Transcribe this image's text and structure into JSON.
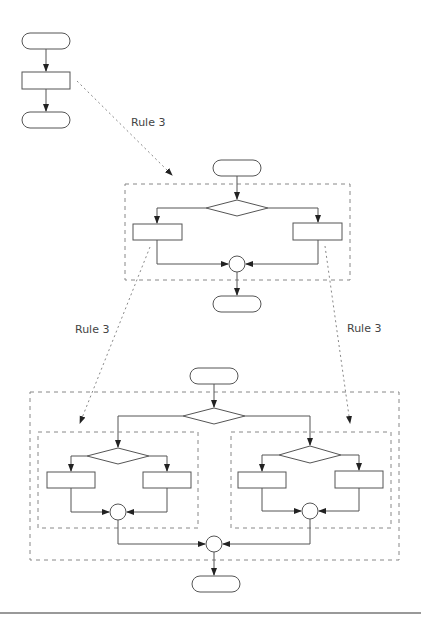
{
  "diagram": {
    "labels": {
      "rule_top": "Rule 3",
      "rule_left": "Rule 3",
      "rule_right": "Rule 3"
    },
    "stages": [
      {
        "name": "sequence",
        "nodes": [
          "terminal",
          "process",
          "terminal"
        ]
      },
      {
        "name": "if-else",
        "nodes": [
          "terminal",
          "decision",
          "process-left",
          "process-right",
          "join",
          "terminal"
        ]
      },
      {
        "name": "nested-if-else",
        "nodes": [
          "terminal",
          "decision",
          "sub-block-left",
          "sub-block-right",
          "join",
          "terminal"
        ]
      }
    ],
    "colors": {
      "stroke": "#555555",
      "dashed": "#888888",
      "footer_rule": "#999999"
    }
  }
}
